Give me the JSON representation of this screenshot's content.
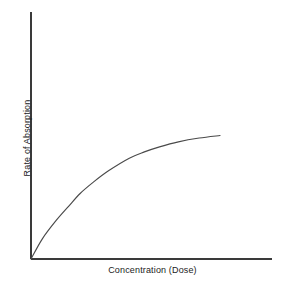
{
  "figure": {
    "background_color": "#ffffff",
    "line_color": "#4a4a4a",
    "axis_color": "#3a3a3a"
  },
  "chart_data": {
    "type": "line",
    "title": "",
    "subtitle": "",
    "xlabel": "Concentration (Dose)",
    "ylabel": "Rate of Absorption",
    "grid": false,
    "legend": null,
    "axis_ticks": {
      "x": [],
      "y": []
    },
    "xlim": [
      0,
      1
    ],
    "ylim": [
      0,
      1
    ],
    "annotations": [],
    "series": [
      {
        "name": "Saturation curve",
        "description": "Rate of absorption rises steeply then plateaus as concentration increases (saturable carrier-mediated transport)",
        "x": [
          0.0,
          0.06,
          0.13,
          0.2,
          0.26,
          0.33,
          0.41,
          0.52,
          0.6,
          0.68,
          0.78,
          0.89,
          1.0
        ],
        "y": [
          0.0,
          0.16,
          0.3,
          0.42,
          0.52,
          0.61,
          0.7,
          0.8,
          0.85,
          0.89,
          0.93,
          0.96,
          0.98
        ]
      }
    ]
  },
  "axes": {
    "x_axis_label": "Concentration (Dose)",
    "y_axis_label": "Rate of Absorption"
  }
}
